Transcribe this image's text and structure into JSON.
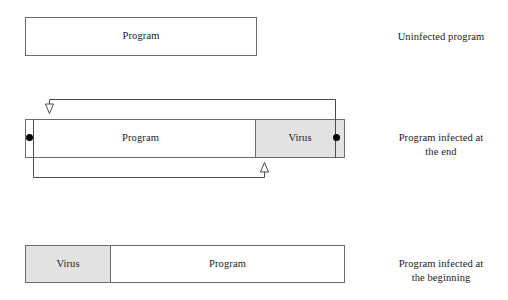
{
  "diagram": {
    "colors": {
      "virus_fill": "#e2e2e2",
      "program_fill": "#ffffff",
      "border": "#6b6b6b",
      "line": "#4a4a4a",
      "marker": "#000000",
      "text": "#1a1a1a"
    },
    "rows": [
      {
        "id": "uninfected",
        "caption": "Uninfected program",
        "segments": [
          {
            "label": "Program",
            "kind": "program"
          }
        ]
      },
      {
        "id": "infected-at-end",
        "caption_line1": "Program infected at",
        "caption_line2": "the end",
        "caption": "Program infected at the end",
        "segments": [
          {
            "label": "Program",
            "kind": "program"
          },
          {
            "label": "Virus",
            "kind": "virus"
          }
        ],
        "markers": [
          {
            "name": "entry-point-marker",
            "position": "left"
          },
          {
            "name": "virus-return-marker",
            "position": "right"
          }
        ],
        "arrows": [
          {
            "name": "jump-to-virus-arrow",
            "from": "program-start",
            "to": "virus-start",
            "direction": "down",
            "path": "above"
          },
          {
            "name": "return-to-program-arrow",
            "from": "virus-end",
            "to": "program-body",
            "direction": "up",
            "path": "below"
          }
        ]
      },
      {
        "id": "infected-at-beginning",
        "caption_line1": "Program infected at",
        "caption_line2": "the beginning",
        "caption": "Program infected at the beginning",
        "segments": [
          {
            "label": "Virus",
            "kind": "virus"
          },
          {
            "label": "Program",
            "kind": "program"
          }
        ]
      }
    ]
  }
}
